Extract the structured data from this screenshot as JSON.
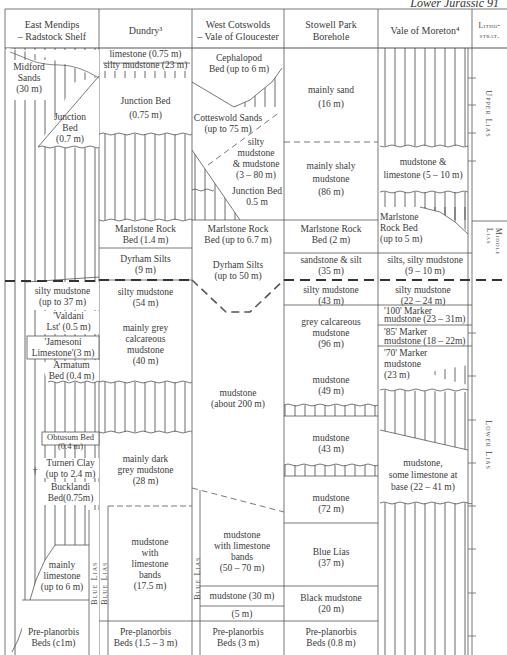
{
  "running_head": "Lower Jurassic   91",
  "columns": [
    {
      "id": "east-mendips",
      "header": "East Mendips\n– Radstock Shelf"
    },
    {
      "id": "dundry",
      "header": "Dundry³"
    },
    {
      "id": "west-cotswolds",
      "header": "West Cotswolds\n– Vale of Gloucester"
    },
    {
      "id": "stowell-park",
      "header": "Stowell Park\nBorehole"
    },
    {
      "id": "vale-of-moreton",
      "header": "Vale of Moreton⁴"
    },
    {
      "id": "lithostrat",
      "header": "Litho-\nstrat."
    }
  ],
  "lithostrat_units": [
    "Upper Lias",
    "Middle Lias",
    "Lower Lias"
  ],
  "east_mendips": {
    "midford": "Midford\nSands\n(30 m)",
    "junction": "Junction\nBed\n(0.7 m)",
    "silty": "silty mudstone\n(up to 37 m)",
    "valdani": "'Valdani\nLst' (0.5 m)",
    "jamesoni": "'Jamesoni\nLimestone'(3 m)",
    "armatum": "Armatum\nBed (0.4 m)",
    "obtusum": "Obtusum Bed\n(0.4 m)",
    "turneri": "Turneri Clay\n(up to 2.4 m)",
    "bucklandi": "Bucklandi\nBed(0.75m)",
    "dagger": "†",
    "limestone": "mainly\nlimestone\n(up to 6 m)",
    "blue_lias": "Blue Lias",
    "preplanorbis": "Pre-planorbis\nBeds (c1m)"
  },
  "dundry": {
    "limestone": "limestone (0.75 m)",
    "silty_top": "silty mudstone (23 m)",
    "junction": "Junction Bed\n(0.75 m)",
    "marlstone": "Marlstone Rock\nBed (1.4 m)",
    "dyrham": "Dyrham Silts\n(9 m)",
    "silty": "silty mudstone\n(54 m)",
    "grey_calc": "mainly grey\ncalcareous\nmudstone\n(40 m)",
    "dark_grey": "mainly dark\ngrey mudstone\n(28 m)",
    "lst_bands": "mudstone\nwith\nlimestone\nbands\n(17.5 m)",
    "blue_lias": "Blue Lias",
    "preplanorbis": "Pre-planorbis\nBeds (1.5 – 3 m)"
  },
  "west_cotswolds": {
    "cephalopod": "Cephalopod\nBed (up to 6 m)",
    "cotteswold": "Cotteswold Sands\n(up to 75 m)",
    "silty": "silty\nmudstone\n& mudstone\n(3 – 80 m)",
    "junction": "Junction Bed\n0.5 m",
    "marlstone": "Marlstone Rock\nBed (up to 6.7 m)",
    "dyrham": "Dyrham Silts\n(up to 50 m)",
    "mudstone": "mudstone\n(about 200 m)",
    "lst_bands": "mudstone\nwith limestone\nbands\n(50 – 70 m)",
    "mud30": "mudstone (30 m)",
    "m5": "(5 m)",
    "blue_lias": "Blue Lias",
    "preplanorbis": "Pre-planorbis\nBeds (3 m)"
  },
  "stowell_park": {
    "sand": "mainly sand\n(16 m)",
    "shaly": "mainly shaly\nmudstone\n(86 m)",
    "marlstone": "Marlstone Rock\nBed (2 m)",
    "sandstone": "sandstone & silt\n(35 m)",
    "silty": "silty mudstone\n(43 m)",
    "grey_calc": "grey calcareous\nmudstone\n(96 m)",
    "mud49": "mudstone\n(49 m)",
    "mud43": "mudstone\n(43 m)",
    "mud72": "mudstone\n(72 m)",
    "blue_lias": "Blue Lias\n(37 m)",
    "black": "Black mudstone\n(20 m)",
    "preplanorbis": "Pre-planorbis\nBeds (0.8 m)"
  },
  "vale_of_moreton": {
    "mud_lst": "mudstone &\nlimestone (5 – 10 m)",
    "marlstone": "Marlstone\nRock Bed\n(up to 5 m)",
    "silts": "silts, silty mudstone\n(9 – 10 m)",
    "silty": "silty mudstone\n(22 – 24 m)",
    "m100": "'100' Marker",
    "mud100": "mudstone (23 – 31m)",
    "m85": "'85' Marker",
    "mud85": "mudstone (18 – 22m)",
    "m70": "'70' Marker",
    "mud70": "mudstone\n(23 m)",
    "base": "mudstone,\nsome limestone at\nbase (22 – 41 m)"
  }
}
